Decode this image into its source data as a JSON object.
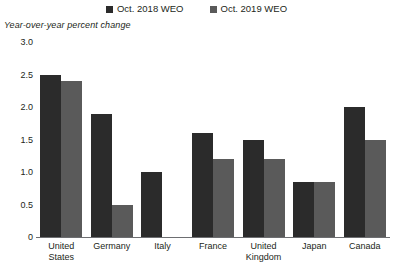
{
  "chart_data": {
    "type": "bar",
    "title": "",
    "subtitle": "Year-over-year percent change",
    "xlabel": "",
    "ylabel": "",
    "ylim": [
      0,
      3.0
    ],
    "ytick_labels": [
      "3.0",
      "2.5",
      "2.0",
      "1.5",
      "1.0",
      "0.5",
      "0"
    ],
    "ytick_values": [
      3.0,
      2.5,
      2.0,
      1.5,
      1.0,
      0.5,
      0
    ],
    "grid": false,
    "legend_position": "top-center",
    "categories": [
      "United States",
      "Germany",
      "Italy",
      "France",
      "United Kingdom",
      "Japan",
      "Canada"
    ],
    "category_lines": [
      [
        "United",
        "States"
      ],
      [
        "Germany"
      ],
      [
        "Italy"
      ],
      [
        "France"
      ],
      [
        "United",
        "Kingdom"
      ],
      [
        "Japan"
      ],
      [
        "Canada"
      ]
    ],
    "series": [
      {
        "name": "Oct. 2018 WEO",
        "color": "#2b2b2b",
        "values": [
          2.5,
          1.9,
          1.0,
          1.6,
          1.5,
          0.85,
          2.0
        ]
      },
      {
        "name": "Oct. 2019 WEO",
        "color": "#5a5a5a",
        "values": [
          2.4,
          0.5,
          0.0,
          1.2,
          1.2,
          0.85,
          1.5
        ]
      }
    ]
  },
  "legend": {
    "items": [
      {
        "label": "Oct. 2018 WEO",
        "color": "#2b2b2b"
      },
      {
        "label": "Oct. 2019 WEO",
        "color": "#5a5a5a"
      }
    ]
  },
  "colors": {
    "series_2018": "#2b2b2b",
    "series_2019": "#5a5a5a",
    "axis": "#6d6e71",
    "text": "#231f20",
    "background": "#ffffff"
  }
}
